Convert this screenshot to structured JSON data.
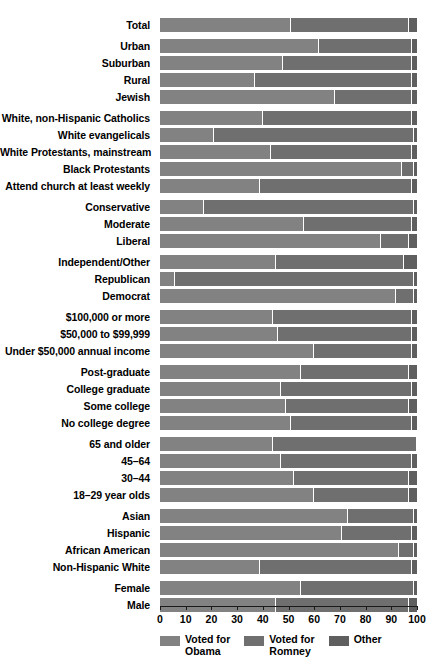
{
  "chart_data": {
    "type": "bar",
    "subtype": "stacked-horizontal-100pct",
    "title": "",
    "xlabel": "",
    "ylabel": "",
    "xlim": [
      0,
      100
    ],
    "xticks": [
      0,
      10,
      20,
      30,
      40,
      50,
      60,
      70,
      80,
      90,
      100
    ],
    "xticklabels": [
      "0",
      "10",
      "20",
      "30",
      "40",
      "50",
      "60",
      "70",
      "80",
      "90",
      "100"
    ],
    "grid": false,
    "legend_position": "bottom",
    "series": [
      {
        "name": "Voted for Obama",
        "color": "#828282"
      },
      {
        "name": "Voted for Romney",
        "color": "#6f6f6f"
      },
      {
        "name": "Other",
        "color": "#5f5f5f"
      }
    ],
    "groups": [
      {
        "name": "total",
        "rows": [
          {
            "category": "Total",
            "values": [
              51,
              46,
              3
            ]
          }
        ]
      },
      {
        "name": "community-type-and-religion-jewish",
        "rows": [
          {
            "category": "Urban",
            "values": [
              62,
              36,
              2
            ]
          },
          {
            "category": "Suburban",
            "values": [
              48,
              50,
              2
            ]
          },
          {
            "category": "Rural",
            "values": [
              37,
              61,
              2
            ]
          },
          {
            "category": "Jewish",
            "values": [
              68,
              30,
              2
            ]
          }
        ]
      },
      {
        "name": "religion",
        "rows": [
          {
            "category": "White, non-Hispanic Catholics",
            "values": [
              40,
              58,
              2
            ]
          },
          {
            "category": "White evangelicals",
            "values": [
              21,
              78,
              1
            ]
          },
          {
            "category": "White Protestants, mainstream",
            "values": [
              43,
              55,
              2
            ]
          },
          {
            "category": "Black Protestants",
            "values": [
              94,
              5,
              1
            ]
          },
          {
            "category": "Attend church at least weekly",
            "values": [
              39,
              59,
              2
            ]
          }
        ]
      },
      {
        "name": "ideology",
        "rows": [
          {
            "category": "Conservative",
            "values": [
              17,
              82,
              1
            ]
          },
          {
            "category": "Moderate",
            "values": [
              56,
              42,
              2
            ]
          },
          {
            "category": "Liberal",
            "values": [
              86,
              11,
              3
            ]
          }
        ]
      },
      {
        "name": "party",
        "rows": [
          {
            "category": "Independent/Other",
            "values": [
              45,
              50,
              5
            ]
          },
          {
            "category": "Republican",
            "values": [
              6,
              93,
              1
            ]
          },
          {
            "category": "Democrat",
            "values": [
              92,
              7,
              1
            ]
          }
        ]
      },
      {
        "name": "income",
        "rows": [
          {
            "category": "$100,000 or more",
            "values": [
              44,
              54,
              2
            ]
          },
          {
            "category": "$50,000 to $99,999",
            "values": [
              46,
              52,
              2
            ]
          },
          {
            "category": "Under $50,000 annual income",
            "values": [
              60,
              38,
              2
            ]
          }
        ]
      },
      {
        "name": "education",
        "rows": [
          {
            "category": "Post-graduate",
            "values": [
              55,
              42,
              3
            ]
          },
          {
            "category": "College graduate",
            "values": [
              47,
              51,
              2
            ]
          },
          {
            "category": "Some college",
            "values": [
              49,
              48,
              3
            ]
          },
          {
            "category": "No college degree",
            "values": [
              51,
              47,
              2
            ]
          }
        ]
      },
      {
        "name": "age",
        "rows": [
          {
            "category": "65 and older",
            "values": [
              44,
              56,
              0
            ]
          },
          {
            "category": "45–64",
            "values": [
              47,
              51,
              2
            ]
          },
          {
            "category": "30–44",
            "values": [
              52,
              45,
              3
            ]
          },
          {
            "category": "18–29 year olds",
            "values": [
              60,
              37,
              3
            ]
          }
        ]
      },
      {
        "name": "race-ethnicity",
        "rows": [
          {
            "category": "Asian",
            "values": [
              73,
              26,
              1
            ]
          },
          {
            "category": "Hispanic",
            "values": [
              71,
              27,
              2
            ]
          },
          {
            "category": "African American",
            "values": [
              93,
              6,
              1
            ]
          },
          {
            "category": "Non-Hispanic White",
            "values": [
              39,
              59,
              2
            ]
          }
        ]
      },
      {
        "name": "gender",
        "rows": [
          {
            "category": "Female",
            "values": [
              55,
              44,
              1
            ]
          },
          {
            "category": "Male",
            "values": [
              45,
              52,
              3
            ]
          }
        ]
      }
    ]
  },
  "legend": {
    "items": [
      {
        "label": "Voted for\nObama",
        "color": "#828282",
        "swatch_name": "legend-swatch-obama"
      },
      {
        "label": "Voted for\nRomney",
        "color": "#6f6f6f",
        "swatch_name": "legend-swatch-romney"
      },
      {
        "label": "Other",
        "color": "#5f5f5f",
        "swatch_name": "legend-swatch-other"
      }
    ]
  },
  "axis": {
    "ticks": [
      "0",
      "10",
      "20",
      "30",
      "40",
      "50",
      "60",
      "70",
      "80",
      "90",
      "100"
    ]
  }
}
